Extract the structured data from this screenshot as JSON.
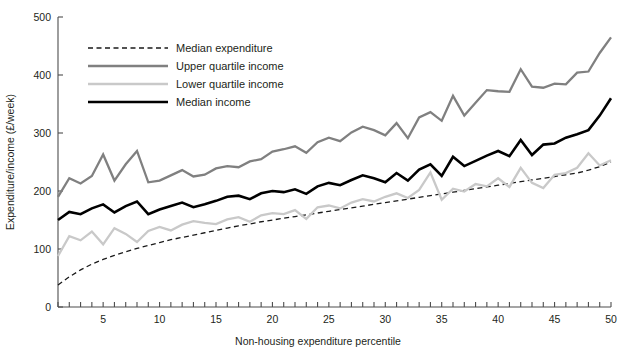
{
  "chart_data": {
    "type": "line",
    "title": "",
    "xlabel": "Non-housing expenditure percentile",
    "ylabel": "Expenditure/income (£/week)",
    "xlim": [
      1,
      50
    ],
    "ylim": [
      0,
      500
    ],
    "xticks": [
      5,
      10,
      15,
      20,
      25,
      30,
      35,
      40,
      45,
      50
    ],
    "xtick_labels": [
      "5",
      "10",
      "15",
      "20",
      "25",
      "30",
      "35",
      "40",
      "45",
      "50"
    ],
    "xminor_step": 1,
    "yticks": [
      0,
      100,
      200,
      300,
      400,
      500
    ],
    "ytick_labels": [
      "0",
      "100",
      "200",
      "300",
      "400",
      "500"
    ],
    "grid": false,
    "legend_position": "top-left",
    "x": [
      1,
      2,
      3,
      4,
      5,
      6,
      7,
      8,
      9,
      10,
      11,
      12,
      13,
      14,
      15,
      16,
      17,
      18,
      19,
      20,
      21,
      22,
      23,
      24,
      25,
      26,
      27,
      28,
      29,
      30,
      31,
      32,
      33,
      34,
      35,
      36,
      37,
      38,
      39,
      40,
      41,
      42,
      43,
      44,
      45,
      46,
      47,
      48,
      49,
      50
    ],
    "series": [
      {
        "name": "Median expenditure",
        "style": "dashed",
        "color": "#1a1a1a",
        "width": 1.3,
        "values": [
          38,
          52,
          64,
          74,
          82,
          89,
          95,
          101,
          106,
          111,
          116,
          120,
          124,
          128,
          132,
          136,
          140,
          143,
          147,
          150,
          153,
          156,
          159,
          162,
          165,
          168,
          171,
          174,
          177,
          180,
          183,
          186,
          189,
          192,
          195,
          198,
          201,
          204,
          207,
          210,
          213,
          216,
          219,
          222,
          225,
          228,
          231,
          236,
          242,
          250
        ]
      },
      {
        "name": "Upper quartile income",
        "style": "solid",
        "color": "#808080",
        "width": 2.3,
        "values": [
          190,
          222,
          213,
          226,
          263,
          218,
          246,
          269,
          215,
          218,
          227,
          236,
          225,
          228,
          239,
          243,
          241,
          251,
          255,
          268,
          272,
          277,
          266,
          284,
          292,
          286,
          301,
          311,
          305,
          296,
          317,
          291,
          327,
          336,
          321,
          364,
          330,
          352,
          374,
          372,
          371,
          410,
          380,
          378,
          385,
          384,
          404,
          406,
          438,
          465
        ]
      },
      {
        "name": "Lower quartile income",
        "style": "solid",
        "color": "#c9c9c9",
        "width": 2.3,
        "values": [
          88,
          122,
          115,
          130,
          108,
          136,
          126,
          112,
          131,
          138,
          132,
          142,
          148,
          145,
          143,
          151,
          155,
          147,
          158,
          162,
          160,
          167,
          152,
          172,
          175,
          170,
          180,
          186,
          182,
          190,
          196,
          188,
          202,
          232,
          185,
          204,
          199,
          212,
          208,
          222,
          207,
          240,
          214,
          205,
          228,
          231,
          240,
          265,
          244,
          253
        ]
      },
      {
        "name": "Median income",
        "style": "solid",
        "color": "#000000",
        "width": 2.6,
        "values": [
          150,
          164,
          160,
          170,
          177,
          163,
          174,
          182,
          160,
          168,
          174,
          180,
          172,
          177,
          183,
          190,
          192,
          186,
          196,
          200,
          198,
          203,
          195,
          208,
          214,
          210,
          219,
          227,
          222,
          215,
          231,
          218,
          237,
          246,
          226,
          259,
          243,
          252,
          261,
          269,
          260,
          288,
          262,
          280,
          282,
          292,
          298,
          305,
          330,
          360
        ]
      }
    ]
  },
  "legend": {
    "items": [
      {
        "label": "Median expenditure"
      },
      {
        "label": "Upper quartile income"
      },
      {
        "label": "Lower quartile income"
      },
      {
        "label": "Median income"
      }
    ]
  }
}
